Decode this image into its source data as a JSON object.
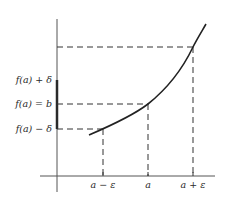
{
  "diagram": {
    "y_labels": {
      "upper": "f(a) + δ",
      "middle": "f(a) = b",
      "lower": "f(a) − δ"
    },
    "x_labels": {
      "left": "a − ε",
      "middle": "a",
      "right": "a + ε"
    },
    "colors": {
      "line": "#2a2a2a",
      "background": "#ffffff"
    }
  }
}
